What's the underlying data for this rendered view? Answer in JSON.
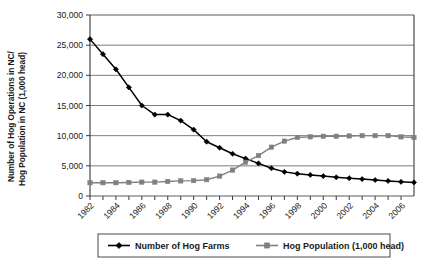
{
  "chart_data": {
    "type": "line",
    "title": "",
    "xlabel": "",
    "ylabel": "Number of Hog Operations in NC/ Hog Population in NC (1,000 head)",
    "ylabel_line1": "Number of Hog Operations in NC/",
    "ylabel_line2": "Hog Population in NC (1,000 head)",
    "ylim": [
      0,
      30000
    ],
    "yticks": [
      0,
      5000,
      10000,
      15000,
      20000,
      25000,
      30000
    ],
    "ytick_labels": [
      "0",
      "5,000",
      "10,000",
      "15,000",
      "20,000",
      "25,000",
      "30,000"
    ],
    "xlim": [
      1982,
      2007
    ],
    "x": [
      1982,
      1983,
      1984,
      1985,
      1986,
      1987,
      1988,
      1989,
      1990,
      1991,
      1992,
      1993,
      1994,
      1995,
      1996,
      1997,
      1998,
      1999,
      2000,
      2001,
      2002,
      2003,
      2004,
      2005,
      2006,
      2007
    ],
    "xtick_labels": [
      "1982",
      "1984",
      "1986",
      "1988",
      "1990",
      "1992",
      "1994",
      "1996",
      "1998",
      "2000",
      "2002",
      "2004",
      "2006"
    ],
    "xticks_major": [
      1982,
      1984,
      1986,
      1988,
      1990,
      1992,
      1994,
      1996,
      1998,
      2000,
      2002,
      2004,
      2006
    ],
    "grid": "horizontal",
    "legend_position": "bottom",
    "series": [
      {
        "name": "Number of Hog Farms",
        "color": "#000000",
        "marker": "diamond",
        "values": [
          26000,
          23500,
          21000,
          18000,
          15000,
          13500,
          13500,
          12500,
          11000,
          9000,
          8000,
          7000,
          6200,
          5400,
          4600,
          4000,
          3700,
          3500,
          3300,
          3100,
          2950,
          2800,
          2650,
          2500,
          2350,
          2250
        ]
      },
      {
        "name": "Hog Population (1,000 head)",
        "color": "#808080",
        "marker": "square",
        "values": [
          2200,
          2200,
          2200,
          2250,
          2300,
          2300,
          2400,
          2500,
          2550,
          2700,
          3300,
          4300,
          5600,
          6700,
          8100,
          9100,
          9700,
          9800,
          9900,
          9900,
          9950,
          10000,
          10000,
          10000,
          9800,
          9700
        ]
      }
    ]
  },
  "legend": {
    "entries": [
      {
        "label": "Number of Hog Farms",
        "color": "#000000",
        "marker": "diamond"
      },
      {
        "label": "Hog Population (1,000 head)",
        "color": "#808080",
        "marker": "square"
      }
    ]
  }
}
